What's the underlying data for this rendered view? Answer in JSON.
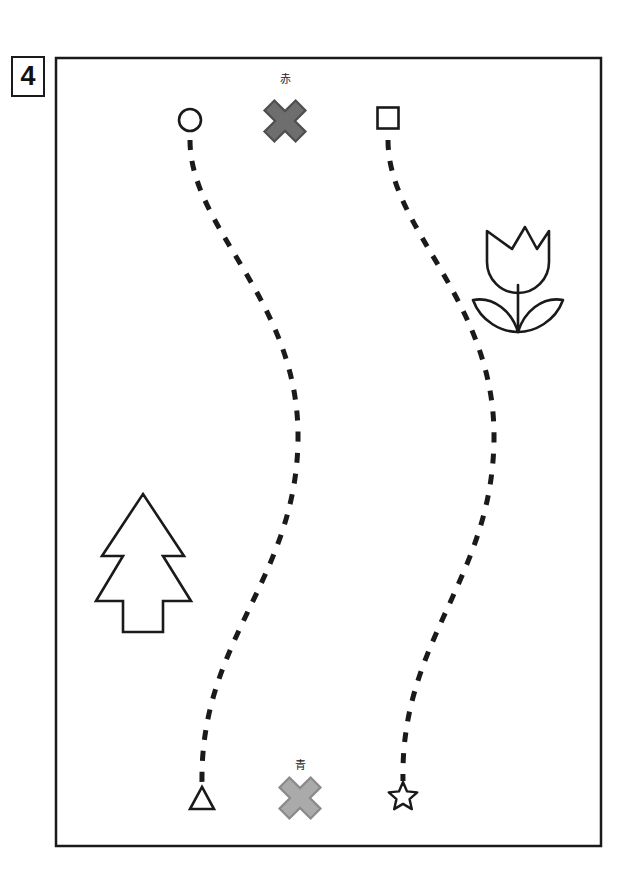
{
  "worksheet": {
    "problem_number": "4",
    "frame": {
      "x": 55,
      "y": 57,
      "width": 545,
      "height": 788,
      "stroke": "#1a1a1a",
      "stroke_width": 2,
      "fill": "#ffffff"
    },
    "canvas": {
      "width": 629,
      "height": 893,
      "background": "#ffffff"
    }
  },
  "colors": {
    "ink": "#1a1a1a",
    "outline": "#222222",
    "cross_red_fill": "#6e6e6e",
    "cross_red_stroke": "#4f4f4f",
    "cross_blue_fill": "#aaaaaa",
    "cross_blue_stroke": "#8a8a8a",
    "dash": "#1a1a1a"
  },
  "markers": {
    "red_cross": {
      "label": "赤",
      "label_meaning": "red",
      "cx": 285,
      "cy": 121,
      "size": 44,
      "arm": 14,
      "fill": "#6e6e6e",
      "stroke": "#4f4f4f",
      "label_x": 285,
      "label_y": 82
    },
    "blue_cross": {
      "label": "青",
      "label_meaning": "blue",
      "cx": 300,
      "cy": 798,
      "size": 44,
      "arm": 14,
      "fill": "#aaaaaa",
      "stroke": "#8a8a8a",
      "label_x": 300,
      "label_y": 768
    }
  },
  "endpoints": {
    "top": [
      {
        "name": "circle",
        "shape": "circle",
        "cx": 190,
        "cy": 120,
        "r": 11
      },
      {
        "name": "square",
        "shape": "square",
        "cx": 388,
        "cy": 118,
        "size": 21
      }
    ],
    "bottom": [
      {
        "name": "triangle",
        "shape": "triangle",
        "cx": 202,
        "cy": 798,
        "size": 24
      },
      {
        "name": "star",
        "shape": "star",
        "cx": 403,
        "cy": 797,
        "r": 15
      }
    ]
  },
  "paths": [
    {
      "name": "left-dashed-path",
      "from": "circle",
      "to": "triangle",
      "d": "M 190 140 C 190 230 300 300 298 440 C 296 580 200 640 202 782",
      "dash": "10 11",
      "stroke": "#1a1a1a",
      "stroke_width": 5
    },
    {
      "name": "right-dashed-path",
      "from": "square",
      "to": "star",
      "d": "M 388 140 C 388 230 496 300 494 440 C 492 580 400 640 403 781",
      "dash": "10 11",
      "stroke": "#1a1a1a",
      "stroke_width": 5
    }
  ],
  "decorations": [
    {
      "name": "tulip",
      "cx": 518,
      "cy": 278,
      "description": "outlined tulip flower with two leaves"
    },
    {
      "name": "pine-tree",
      "cx": 143,
      "cy": 562,
      "description": "outlined two-tier pine tree"
    }
  ]
}
